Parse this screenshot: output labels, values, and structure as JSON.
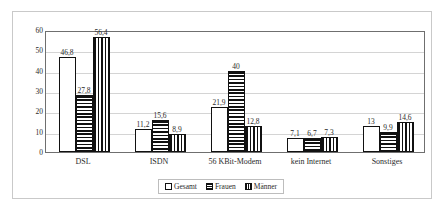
{
  "chart_data": {
    "type": "bar",
    "title": "",
    "subtitle": "",
    "xlabel": "",
    "ylabel": "",
    "categories": [
      "DSL",
      "ISDN",
      "56 KBit-Modem",
      "kein Internet",
      "Sonstiges"
    ],
    "series": [
      {
        "name": "Gesamt",
        "pattern": "solid-white",
        "values": [
          46.8,
          11.2,
          21.9,
          7.1,
          13
        ],
        "labels": [
          "46,8",
          "11,2",
          "21,9",
          "7,1",
          "13"
        ]
      },
      {
        "name": "Frauen",
        "pattern": "horizontal-stripes",
        "values": [
          27.8,
          15.6,
          40,
          6.7,
          9.9
        ],
        "labels": [
          "27,8",
          "15,6",
          "40",
          "6,7",
          "9,9"
        ]
      },
      {
        "name": "Männer",
        "pattern": "vertical-stripes",
        "values": [
          56.4,
          8.9,
          12.8,
          7.3,
          14.6
        ],
        "labels": [
          "56,4",
          "8,9",
          "12,8",
          "7,3",
          "14,6"
        ]
      }
    ],
    "ylim": [
      0,
      60
    ],
    "yticks": [
      0,
      10,
      20,
      30,
      40,
      50,
      60
    ],
    "ytick_labels": [
      "0",
      "10",
      "20",
      "30",
      "40",
      "50",
      "60"
    ],
    "grid": "horizontal",
    "legend_position": "bottom-center",
    "colors": {
      "axis": "#6f6f6f",
      "grid": "#d4d4d4",
      "bar_outline": "#111111",
      "bar_fill": "#ffffff",
      "text": "#2b2b2b",
      "frame": "#c9c9c9",
      "background": "#ffffff"
    }
  },
  "legend": {
    "items": [
      {
        "label": "Gesamt"
      },
      {
        "label": "Frauen"
      },
      {
        "label": "Männer"
      }
    ]
  }
}
